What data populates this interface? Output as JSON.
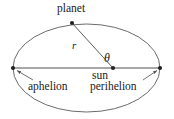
{
  "figure": {
    "type": "orbit-diagram",
    "background_color": "#ffffff",
    "stroke_color": "#555555",
    "text_color": "#1a1a1a"
  },
  "labels": {
    "planet": "planet",
    "sun": "sun",
    "aphelion": "aphelion",
    "perihelion": "perihelion",
    "radius": "r",
    "angle": "θ"
  },
  "geometry": {
    "ellipse": {
      "center_x": 86.5,
      "center_y": 68,
      "semi_major": 73.5,
      "semi_minor": 44
    },
    "points": {
      "sun": {
        "x": 113,
        "y": 68
      },
      "planet": {
        "x": 72,
        "y": 23
      },
      "aphelion": {
        "x": 13,
        "y": 68
      },
      "perihelion": {
        "x": 160,
        "y": 68
      }
    },
    "major_axis": {
      "x1": 13,
      "y1": 68,
      "x2": 160,
      "y2": 68
    },
    "radius_line": {
      "x1": 113,
      "y1": 68,
      "x2": 72,
      "y2": 23
    },
    "leader_aphelion": {
      "x1": 33,
      "y1": 80,
      "x2": 16,
      "y2": 70
    },
    "leader_perihelion": {
      "x1": 143,
      "y1": 80,
      "x2": 158,
      "y2": 70
    }
  }
}
